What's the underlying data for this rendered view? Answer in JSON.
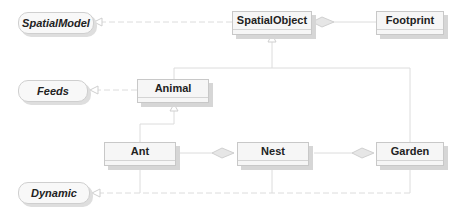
{
  "diagram": {
    "type": "UML class diagram",
    "interfaces": [
      {
        "id": "spatialmodel",
        "label": "SpatialModel"
      },
      {
        "id": "feeds",
        "label": "Feeds"
      },
      {
        "id": "dynamic",
        "label": "Dynamic"
      }
    ],
    "classes": [
      {
        "id": "spatialobject",
        "label": "SpatialObject"
      },
      {
        "id": "footprint",
        "label": "Footprint"
      },
      {
        "id": "animal",
        "label": "Animal"
      },
      {
        "id": "ant",
        "label": "Ant"
      },
      {
        "id": "nest",
        "label": "Nest"
      },
      {
        "id": "garden",
        "label": "Garden"
      }
    ],
    "relations": [
      {
        "from": "SpatialObject",
        "to": "SpatialModel",
        "kind": "realization"
      },
      {
        "from": "SpatialObject",
        "to": "Footprint",
        "kind": "aggregation"
      },
      {
        "from": "Animal",
        "to": "SpatialObject",
        "kind": "generalization"
      },
      {
        "from": "Garden",
        "to": "SpatialObject",
        "kind": "generalization"
      },
      {
        "from": "Animal",
        "to": "Feeds",
        "kind": "realization"
      },
      {
        "from": "Ant",
        "to": "Animal",
        "kind": "generalization"
      },
      {
        "from": "Nest",
        "to": "Ant",
        "kind": "aggregation"
      },
      {
        "from": "Garden",
        "to": "Nest",
        "kind": "aggregation"
      },
      {
        "from": "Nest",
        "to": "Dynamic",
        "kind": "realization"
      },
      {
        "from": "Garden",
        "to": "Dynamic",
        "kind": "realization"
      }
    ]
  }
}
